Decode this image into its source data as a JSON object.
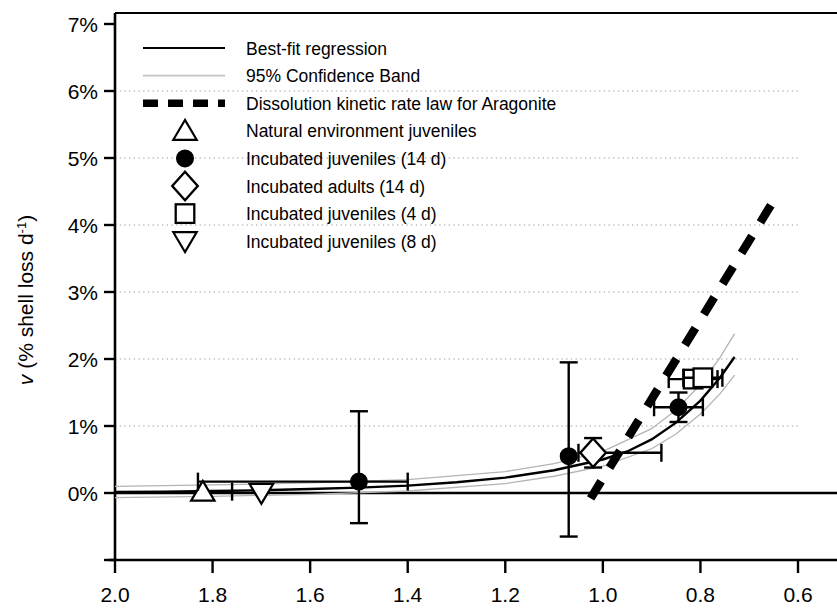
{
  "chart_data": {
    "type": "scatter",
    "title": "",
    "xlabel": "",
    "ylabel": "v (% shell loss d-1)",
    "ylabel_parts": {
      "italic": "v",
      "rest": " (% shell loss d",
      "sup": "-1",
      "tail": ")"
    },
    "xlim": [
      2.0,
      0.6
    ],
    "ylim": [
      -1,
      7
    ],
    "x_reversed": true,
    "grid": true,
    "grid_style": "dotted horizontal",
    "legend_position": "top-left inside",
    "xticks": [
      2.0,
      1.8,
      1.6,
      1.4,
      1.2,
      1.0,
      0.8,
      0.6
    ],
    "xtick_labels": [
      "2.0",
      "1.8",
      "1.6",
      "1.4",
      "1.2",
      "1.0",
      "0.8",
      "0.6"
    ],
    "yticks": [
      -1,
      0,
      1,
      2,
      3,
      4,
      5,
      6,
      7
    ],
    "ytick_labels": [
      "",
      "0%",
      "1%",
      "2%",
      "3%",
      "4%",
      "5%",
      "6%",
      "7%"
    ],
    "legend": [
      {
        "label": "Best-fit regression",
        "marker": "solid-line"
      },
      {
        "label": "95% Confidence Band",
        "marker": "thin-gray-line"
      },
      {
        "label": "Dissolution kinetic rate law for Aragonite",
        "marker": "dashed-thick-line"
      },
      {
        "label": "Natural environment juveniles",
        "marker": "triangle-up-open"
      },
      {
        "label": "Incubated juveniles (14 d)",
        "marker": "circle-filled"
      },
      {
        "label": "Incubated adults (14 d)",
        "marker": "diamond-open"
      },
      {
        "label": "Incubated juveniles (4 d)",
        "marker": "square-open"
      },
      {
        "label": "Incubated juveniles (8 d)",
        "marker": "triangle-down-open"
      }
    ],
    "series": [
      {
        "name": "Natural environment juveniles",
        "marker": "triangle-up-open",
        "points": [
          {
            "x": 1.82,
            "y": 0.02,
            "xerr": [
              0.0,
              0.06
            ],
            "yerr": [
              0.0,
              0.0
            ]
          }
        ]
      },
      {
        "name": "Incubated juveniles (8 d)",
        "marker": "triangle-down-open",
        "points": [
          {
            "x": 1.7,
            "y": 0.0,
            "xerr": [
              0.0,
              0.0
            ],
            "yerr": [
              0.0,
              0.0
            ]
          }
        ]
      },
      {
        "name": "Incubated juveniles (14 d)",
        "marker": "circle-filled",
        "points": [
          {
            "x": 1.5,
            "y": 0.17,
            "xerr": [
              0.33,
              0.1
            ],
            "yerr": [
              1.05,
              0.62
            ]
          },
          {
            "x": 1.07,
            "y": 0.55,
            "xerr": [
              0.0,
              0.0
            ],
            "yerr": [
              1.4,
              1.2
            ]
          },
          {
            "x": 0.845,
            "y": 1.28,
            "xerr": [
              0.05,
              0.05
            ],
            "yerr": [
              0.22,
              0.22
            ]
          }
        ]
      },
      {
        "name": "Incubated adults (14 d)",
        "marker": "diamond-open",
        "points": [
          {
            "x": 1.02,
            "y": 0.6,
            "xerr": [
              0.03,
              0.14
            ],
            "yerr": [
              0.22,
              0.22
            ]
          }
        ]
      },
      {
        "name": "Incubated juveniles (4 d)",
        "marker": "square-open",
        "points": [
          {
            "x": 0.815,
            "y": 1.7,
            "xerr": [
              0.05,
              0.05
            ],
            "yerr": [
              0.06,
              0.06
            ]
          },
          {
            "x": 0.795,
            "y": 1.72,
            "xerr": [
              0.04,
              0.04
            ],
            "yerr": [
              0.06,
              0.06
            ]
          }
        ]
      }
    ],
    "fit_curve": {
      "name": "Best-fit regression",
      "points": [
        {
          "x": 2.0,
          "y": 0.015
        },
        {
          "x": 1.9,
          "y": 0.02
        },
        {
          "x": 1.8,
          "y": 0.03
        },
        {
          "x": 1.7,
          "y": 0.04
        },
        {
          "x": 1.6,
          "y": 0.06
        },
        {
          "x": 1.5,
          "y": 0.08
        },
        {
          "x": 1.4,
          "y": 0.11
        },
        {
          "x": 1.3,
          "y": 0.16
        },
        {
          "x": 1.2,
          "y": 0.23
        },
        {
          "x": 1.1,
          "y": 0.34
        },
        {
          "x": 1.0,
          "y": 0.5
        },
        {
          "x": 0.95,
          "y": 0.62
        },
        {
          "x": 0.9,
          "y": 0.8
        },
        {
          "x": 0.85,
          "y": 1.05
        },
        {
          "x": 0.8,
          "y": 1.38
        },
        {
          "x": 0.76,
          "y": 1.72
        },
        {
          "x": 0.73,
          "y": 2.03
        }
      ]
    },
    "confidence_band": {
      "name": "95% Confidence Band",
      "upper": [
        {
          "x": 2.0,
          "y": 0.1
        },
        {
          "x": 1.8,
          "y": 0.12
        },
        {
          "x": 1.6,
          "y": 0.15
        },
        {
          "x": 1.4,
          "y": 0.2
        },
        {
          "x": 1.2,
          "y": 0.32
        },
        {
          "x": 1.1,
          "y": 0.44
        },
        {
          "x": 1.0,
          "y": 0.62
        },
        {
          "x": 0.9,
          "y": 0.96
        },
        {
          "x": 0.85,
          "y": 1.24
        },
        {
          "x": 0.8,
          "y": 1.62
        },
        {
          "x": 0.76,
          "y": 2.02
        },
        {
          "x": 0.73,
          "y": 2.38
        }
      ],
      "lower": [
        {
          "x": 2.0,
          "y": -0.07
        },
        {
          "x": 1.8,
          "y": -0.05
        },
        {
          "x": 1.6,
          "y": -0.02
        },
        {
          "x": 1.4,
          "y": 0.03
        },
        {
          "x": 1.2,
          "y": 0.14
        },
        {
          "x": 1.1,
          "y": 0.25
        },
        {
          "x": 1.0,
          "y": 0.4
        },
        {
          "x": 0.9,
          "y": 0.66
        },
        {
          "x": 0.85,
          "y": 0.88
        },
        {
          "x": 0.8,
          "y": 1.18
        },
        {
          "x": 0.76,
          "y": 1.48
        },
        {
          "x": 0.73,
          "y": 1.76
        }
      ]
    },
    "kinetic_law_line": {
      "name": "Dissolution kinetic rate law for Aragonite",
      "start": {
        "x": 1.025,
        "y": -0.08
      },
      "end": {
        "x": 0.645,
        "y": 4.42
      }
    }
  }
}
